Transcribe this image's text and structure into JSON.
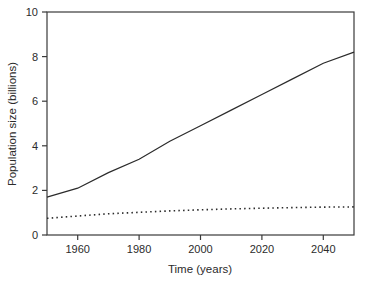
{
  "chart_data": {
    "type": "line",
    "title": "",
    "xlabel": "Time (years)",
    "ylabel": "Population size (billions)",
    "x": [
      1950,
      1960,
      1970,
      1980,
      1990,
      2000,
      2010,
      2020,
      2030,
      2040,
      2050
    ],
    "series": [
      {
        "name": "solid-line-series",
        "style": "solid",
        "values": [
          1.7,
          2.1,
          2.8,
          3.4,
          4.2,
          4.9,
          5.6,
          6.3,
          7.0,
          7.7,
          8.2
        ]
      },
      {
        "name": "dotted-line-series",
        "style": "dotted",
        "values": [
          0.75,
          0.85,
          0.95,
          1.02,
          1.08,
          1.13,
          1.17,
          1.2,
          1.23,
          1.25,
          1.26
        ]
      }
    ],
    "xlim": [
      1950,
      2050
    ],
    "ylim": [
      0,
      10
    ],
    "xticks": [
      1960,
      1980,
      2000,
      2020,
      2040
    ],
    "yticks": [
      0,
      2,
      4,
      6,
      8,
      10
    ],
    "grid": false,
    "legend": "none",
    "axis_color": "#3a3a3a",
    "line_color": "#2b2b2b",
    "text_color": "#2b2b2b",
    "background": "#ffffff"
  }
}
